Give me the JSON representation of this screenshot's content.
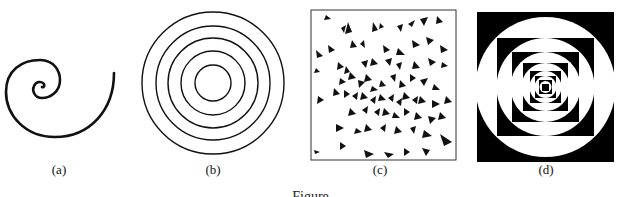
{
  "figure": {
    "panels": [
      {
        "id": "a",
        "label": "(a)",
        "description": "single spiral curve"
      },
      {
        "id": "b",
        "label": "(b)",
        "description": "five concentric circles"
      },
      {
        "id": "c",
        "label": "(c)",
        "description": "random triangles forming swirl pattern"
      },
      {
        "id": "d",
        "label": "(d)",
        "description": "nested squares and circles with alternating black and white"
      }
    ],
    "caption": "Figure"
  },
  "colors": {
    "ink": "#111111",
    "background": "#ffffff"
  }
}
